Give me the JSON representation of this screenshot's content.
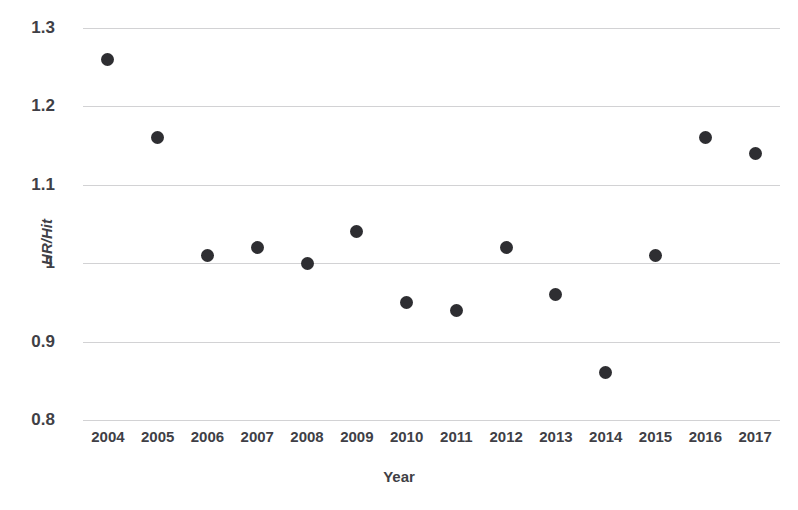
{
  "chart_data": {
    "type": "scatter",
    "title": "",
    "xlabel": "Year",
    "ylabel": "HR/Hit",
    "categories": [
      "2004",
      "2005",
      "2006",
      "2007",
      "2008",
      "2009",
      "2010",
      "2011",
      "2012",
      "2013",
      "2014",
      "2015",
      "2016",
      "2017"
    ],
    "x": [
      2004,
      2005,
      2006,
      2007,
      2008,
      2009,
      2010,
      2011,
      2012,
      2013,
      2014,
      2015,
      2016,
      2017
    ],
    "values": [
      1.26,
      1.16,
      1.01,
      1.02,
      1.0,
      1.04,
      0.95,
      0.94,
      1.02,
      0.96,
      0.86,
      1.01,
      1.16,
      1.14
    ],
    "series": [
      {
        "name": "HR/Hit",
        "values": [
          1.26,
          1.16,
          1.01,
          1.02,
          1.0,
          1.04,
          0.95,
          0.94,
          1.02,
          0.96,
          0.86,
          1.01,
          1.16,
          1.14
        ]
      }
    ],
    "ylim": [
      0.8,
      1.3
    ],
    "yticks": [
      0.8,
      0.9,
      1.0,
      1.1,
      1.2,
      1.3
    ],
    "ytick_labels": [
      "0.8",
      "0.9",
      "1",
      "1.1",
      "1.2",
      "1.3"
    ],
    "grid": true,
    "legend": "none",
    "marker_color": "#2e2e32",
    "gridline_color": "#d2d2d4",
    "background_color": "#ffffff"
  }
}
